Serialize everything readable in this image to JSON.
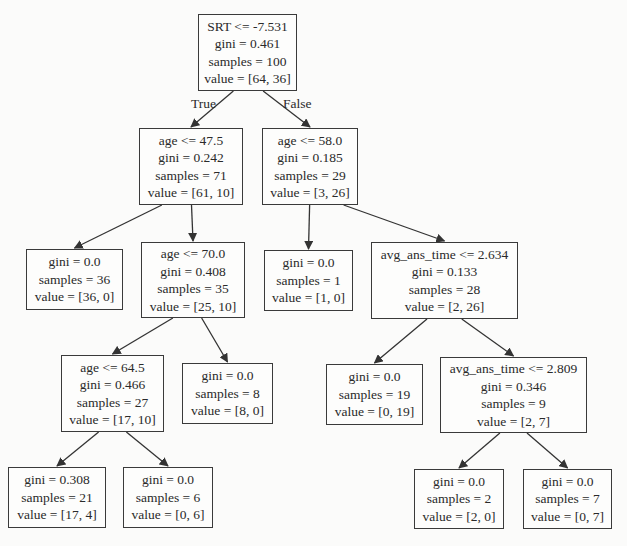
{
  "diagram": {
    "type": "decision-tree",
    "edge_labels": {
      "true": "True",
      "false": "False"
    },
    "nodes": [
      {
        "id": "n0",
        "kind": "split",
        "x": 198,
        "y": 14,
        "w": 99,
        "h": 77,
        "lines": [
          "SRT <= -7.531",
          "gini = 0.461",
          "samples = 100",
          "value = [64, 36]"
        ]
      },
      {
        "id": "n1",
        "kind": "split",
        "x": 139,
        "y": 128,
        "w": 104,
        "h": 77,
        "lines": [
          "age <= 47.5",
          "gini = 0.242",
          "samples = 71",
          "value = [61, 10]"
        ]
      },
      {
        "id": "n2",
        "kind": "split",
        "x": 262,
        "y": 128,
        "w": 96,
        "h": 77,
        "lines": [
          "age <= 58.0",
          "gini = 0.185",
          "samples = 29",
          "value = [3, 26]"
        ]
      },
      {
        "id": "n3",
        "kind": "leaf",
        "x": 26,
        "y": 249,
        "w": 97,
        "h": 61,
        "lines": [
          "gini = 0.0",
          "samples = 36",
          "value = [36, 0]"
        ]
      },
      {
        "id": "n4",
        "kind": "split",
        "x": 141,
        "y": 242,
        "w": 104,
        "h": 76,
        "lines": [
          "age <= 70.0",
          "gini = 0.408",
          "samples = 35",
          "value = [25, 10]"
        ]
      },
      {
        "id": "n5",
        "kind": "leaf",
        "x": 264,
        "y": 250,
        "w": 89,
        "h": 61,
        "lines": [
          "gini = 0.0",
          "samples = 1",
          "value = [1, 0]"
        ]
      },
      {
        "id": "n6",
        "kind": "split",
        "x": 371,
        "y": 242,
        "w": 147,
        "h": 77,
        "lines": [
          "avg_ans_time <= 2.634",
          "gini = 0.133",
          "samples = 28",
          "value = [2, 26]"
        ]
      },
      {
        "id": "n7",
        "kind": "split",
        "x": 61,
        "y": 355,
        "w": 103,
        "h": 77,
        "lines": [
          "age <= 64.5",
          "gini = 0.466",
          "samples = 27",
          "value = [17, 10]"
        ]
      },
      {
        "id": "n8",
        "kind": "leaf",
        "x": 182,
        "y": 363,
        "w": 91,
        "h": 61,
        "lines": [
          "gini = 0.0",
          "samples = 8",
          "value = [8, 0]"
        ]
      },
      {
        "id": "n9",
        "kind": "leaf",
        "x": 326,
        "y": 364,
        "w": 97,
        "h": 61,
        "lines": [
          "gini = 0.0",
          "samples = 19",
          "value = [0, 19]"
        ]
      },
      {
        "id": "n10",
        "kind": "split",
        "x": 440,
        "y": 357,
        "w": 147,
        "h": 76,
        "lines": [
          "avg_ans_time <= 2.809",
          "gini = 0.346",
          "samples = 9",
          "value = [2, 7]"
        ]
      },
      {
        "id": "n11",
        "kind": "leaf",
        "x": 8,
        "y": 467,
        "w": 98,
        "h": 61,
        "lines": [
          "gini = 0.308",
          "samples = 21",
          "value = [17, 4]"
        ]
      },
      {
        "id": "n12",
        "kind": "leaf",
        "x": 123,
        "y": 467,
        "w": 90,
        "h": 61,
        "lines": [
          "gini = 0.0",
          "samples = 6",
          "value = [0, 6]"
        ]
      },
      {
        "id": "n13",
        "kind": "leaf",
        "x": 414,
        "y": 469,
        "w": 90,
        "h": 60,
        "lines": [
          "gini = 0.0",
          "samples = 2",
          "value = [2, 0]"
        ]
      },
      {
        "id": "n14",
        "kind": "leaf",
        "x": 523,
        "y": 469,
        "w": 89,
        "h": 60,
        "lines": [
          "gini = 0.0",
          "samples = 7",
          "value = [0, 7]"
        ]
      }
    ],
    "edges": [
      {
        "from": "n0",
        "to": "n1",
        "label": "True"
      },
      {
        "from": "n0",
        "to": "n2",
        "label": "False"
      },
      {
        "from": "n1",
        "to": "n3"
      },
      {
        "from": "n1",
        "to": "n4"
      },
      {
        "from": "n2",
        "to": "n5"
      },
      {
        "from": "n2",
        "to": "n6"
      },
      {
        "from": "n4",
        "to": "n7"
      },
      {
        "from": "n4",
        "to": "n8"
      },
      {
        "from": "n6",
        "to": "n9"
      },
      {
        "from": "n6",
        "to": "n10"
      },
      {
        "from": "n7",
        "to": "n11"
      },
      {
        "from": "n7",
        "to": "n12"
      },
      {
        "from": "n10",
        "to": "n13"
      },
      {
        "from": "n10",
        "to": "n14"
      }
    ],
    "edge_label_positions": [
      {
        "text_key": "true",
        "x": 191,
        "y": 96
      },
      {
        "text_key": "false",
        "x": 283,
        "y": 96
      }
    ],
    "colors": {
      "background": "#fbfbfa",
      "node_border": "#3a3a3a",
      "edge": "#333333",
      "text": "#2a2a2a"
    }
  }
}
